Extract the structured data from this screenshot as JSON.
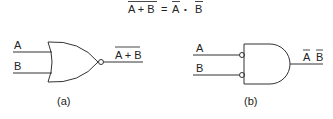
{
  "equation": {
    "lhs": "A + B",
    "equals": "=",
    "rhs_a": "A",
    "dot": "•",
    "rhs_b": "B"
  },
  "gate_a": {
    "type": "NOR",
    "input_1": "A",
    "input_2": "B",
    "output": "A + B",
    "caption": "(a)"
  },
  "gate_b": {
    "type": "AND with inverted inputs",
    "input_1": "A",
    "input_2": "B",
    "output_a": "A",
    "output_b": "B",
    "caption": "(b)"
  }
}
